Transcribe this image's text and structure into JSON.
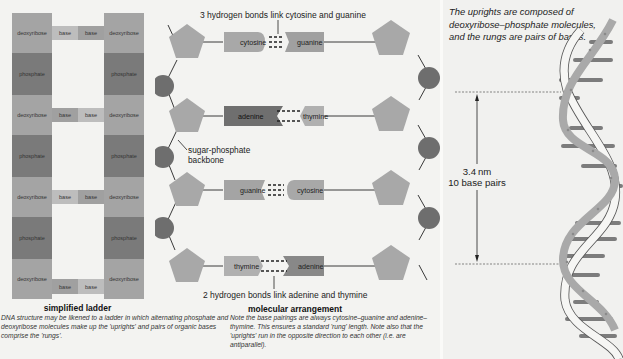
{
  "ladder": {
    "title": "simplified ladder",
    "description": "DNA structure may be likened to a ladder in which alternating phosphate and deoxyribose molecules make up the 'uprights' and pairs of organic bases comprise the 'rungs'.",
    "labels": {
      "deoxyribose": "deoxyribose",
      "phosphate": "phosphate",
      "base": "base"
    },
    "rows": [
      {
        "type": "sugar"
      },
      {
        "type": "phosphate"
      },
      {
        "type": "sugar"
      },
      {
        "type": "phosphate"
      },
      {
        "type": "sugar"
      },
      {
        "type": "phosphate"
      },
      {
        "type": "sugar"
      }
    ]
  },
  "molecular": {
    "title": "molecular arrangement",
    "top_annotation": "3 hydrogen bonds link cytosine and guanine",
    "bottom_annotation": "2 hydrogen bonds link adenine and thymine",
    "backbone_label_line1": "sugar-phosphate",
    "backbone_label_line2": "backbone",
    "description": "Note the base pairings are always cytosine–guanine and adenine–thymine. This ensures a standard 'rung' length. Note also that the 'uprights' run in the opposite direction to each other (i.e. are antiparallel).",
    "pairs": [
      {
        "left": "cytosine",
        "right": "guanine",
        "bonds": 3
      },
      {
        "left": "adenine",
        "right": "thymine",
        "bonds": 2
      },
      {
        "left": "guanine",
        "right": "cytosine",
        "bonds": 3
      },
      {
        "left": "thymine",
        "right": "adenine",
        "bonds": 2
      }
    ]
  },
  "helix": {
    "description": "The uprights are composed of deoxyribose–phosphate molecules, and the rungs are pairs of bases.",
    "measurement_line1": "3.4 nm",
    "measurement_line2": "10 base pairs"
  },
  "colors": {
    "deoxyribose": "#a4a4a4",
    "phosphate": "#7a7a7a",
    "base_light": "#bdbdbd",
    "base_dark": "#a0a0a0",
    "pentagon": "#a8a8a8",
    "phosphate_circle": "#6e6e6e",
    "adenine": "#6f6f6f",
    "helix_strand": "#a9a9a9",
    "helix_rung": "#7c7c7c"
  }
}
